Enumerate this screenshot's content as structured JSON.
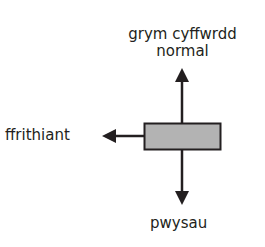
{
  "diagram": {
    "type": "free-body force diagram",
    "object": {
      "shape": "rectangle",
      "fill": "#b3b3b3",
      "stroke": "#231f20"
    },
    "forces": {
      "normal": {
        "label_line1": "grym cyffwrdd",
        "label_line2": "normal",
        "direction": "up"
      },
      "friction": {
        "label": "ffrithiant",
        "direction": "left"
      },
      "weight": {
        "label": "pwysau",
        "direction": "down"
      }
    },
    "colors": {
      "arrow": "#231f20",
      "box_fill": "#b3b3b3",
      "text": "#231f20"
    }
  }
}
